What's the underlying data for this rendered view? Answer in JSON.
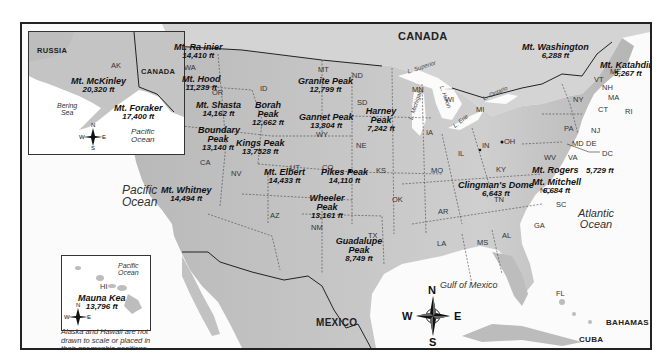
{
  "map": {
    "countries": {
      "canada": "CANADA",
      "mexico": "MEXICO",
      "cuba": "CUBA",
      "bahamas": "BAHAMAS",
      "russia": "RUSSIA",
      "canada_inset": "CANADA"
    },
    "oceans": {
      "pacific_line1": "Pacific",
      "pacific_line2": "Ocean",
      "atlantic_line1": "Atlantic",
      "atlantic_line2": "Ocean",
      "gulf": "Gulf of Mexico"
    },
    "lakes": {
      "superior": "L. Superior",
      "michigan": "L. Michigan",
      "huron": "L. Huron",
      "erie": "L. Erie",
      "ontario": "L. Ontario"
    },
    "states": [
      "WA",
      "OR",
      "CA",
      "ID",
      "NV",
      "MT",
      "WY",
      "UT",
      "CO",
      "AZ",
      "NM",
      "ND",
      "SD",
      "NE",
      "KS",
      "OK",
      "TX",
      "MN",
      "IA",
      "MO",
      "AR",
      "LA",
      "WI",
      "IL",
      "MI",
      "IN",
      "OH",
      "KY",
      "TN",
      "MS",
      "AL",
      "GA",
      "FL",
      "SC",
      "NC",
      "VA",
      "WV",
      "PA",
      "NY",
      "VT",
      "NH",
      "ME",
      "MA",
      "CT",
      "RI",
      "NJ",
      "MD",
      "DE",
      "DC"
    ],
    "peaks": [
      {
        "name": "Mt. Ra inier",
        "height": "14,410 ft"
      },
      {
        "name": "Mt. Hood",
        "height": "11,239 ft"
      },
      {
        "name": "Mt. Shasta",
        "height": "14,162 ft"
      },
      {
        "name": "Boundary Peak",
        "height": "13,140 ft"
      },
      {
        "name": "Mt. Whitney",
        "height": "14,494 ft"
      },
      {
        "name": "Borah Peak",
        "height": "12,662 ft"
      },
      {
        "name": "Granite Peak",
        "height": "12,799 ft"
      },
      {
        "name": "Gannet Peak",
        "height": "13,804 ft"
      },
      {
        "name": "Kings Peak",
        "height": "13,7528 ft"
      },
      {
        "name": "Harney Peak",
        "height": "7,242 ft"
      },
      {
        "name": "Mt. Elbert",
        "height": "14,433 ft"
      },
      {
        "name": "Pikes Peak",
        "height": "14,110 ft"
      },
      {
        "name": "Wheeler Peak",
        "height": "13,161 ft"
      },
      {
        "name": "Guadalupe Peak",
        "height": "8,749 ft"
      },
      {
        "name": "Mt. Washington",
        "height": "6,288 ft"
      },
      {
        "name": "Mt. Katahdin",
        "height": "5,267 ft"
      },
      {
        "name": "Mt. Rogers",
        "height": "5,729 ft"
      },
      {
        "name": "Mt. Mitchell",
        "height": "6,684 ft"
      },
      {
        "name": "Clingman's Dome",
        "height": "6,643 ft"
      }
    ],
    "compass": {
      "n": "N",
      "s": "S",
      "e": "E",
      "w": "W"
    }
  },
  "alaska_inset": {
    "state": "AK",
    "sea_line1": "Bering",
    "sea_line2": "Sea",
    "ocean_line1": "Pacific",
    "ocean_line2": "Ocean",
    "peaks": [
      {
        "name": "Mt. McKinley",
        "height": "20,320 ft"
      },
      {
        "name": "Mt. Foraker",
        "height": "17,400 ft"
      }
    ]
  },
  "hawaii_inset": {
    "state": "HI",
    "ocean_line1": "Pacific",
    "ocean_line2": "Ocean",
    "peak": {
      "name": "Mauna Kea",
      "height": "13,796 ft"
    }
  },
  "note": {
    "line1": "Alaska and Hawaii are not",
    "line2": "drawn to scale or placed in",
    "line3": "their geographic positions."
  },
  "colors": {
    "land": "#c9c9c9",
    "land_dark": "#a9a9a9",
    "water": "#fbfbfb",
    "border": "#222222"
  }
}
